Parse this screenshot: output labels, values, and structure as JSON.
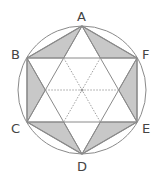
{
  "diagram": {
    "type": "geometry",
    "labels": {
      "A": "A",
      "B": "B",
      "C": "C",
      "D": "D",
      "E": "E",
      "F": "F"
    },
    "colors": {
      "stroke": "#8a8a8a",
      "shade": "#c8c8c8",
      "dotted": "#a0a0a0",
      "label": "#444444"
    }
  }
}
